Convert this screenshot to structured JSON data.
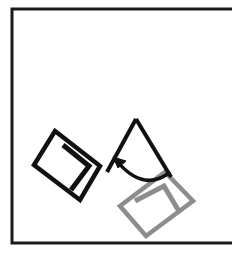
{
  "figure": {
    "title": "Rotation of a square figure",
    "background_color": "#ffffff",
    "frame": {
      "name": "border-frame",
      "stroke_color": "#1a1a1a",
      "stroke_width": 3,
      "x": 11,
      "y": 9,
      "width": 226,
      "height": 234,
      "right_edge_visible": false
    },
    "shapes": [
      {
        "id": "source-square",
        "label": "original square",
        "color": "#111111",
        "stroke_width": 4.5,
        "rotation_deg": -38,
        "points": [
          [
            55,
            131
          ],
          [
            100,
            166
          ],
          [
            80,
            200
          ],
          [
            34,
            165
          ]
        ]
      },
      {
        "id": "source-inner-mark",
        "label": "original inner bracket mark",
        "color": "#111111",
        "stroke_width": 5,
        "points": [
          [
            63,
            145
          ],
          [
            89,
            166
          ],
          [
            71,
            190
          ]
        ]
      },
      {
        "id": "target-square",
        "label": "rotated square copy",
        "color": "#8d8d8d",
        "stroke_width": 4.5,
        "rotation_deg": 42,
        "points": [
          [
            165,
            172
          ],
          [
            193,
            201
          ],
          [
            146,
            236
          ],
          [
            120,
            206
          ]
        ]
      },
      {
        "id": "target-inner-mark",
        "label": "rotated inner bracket mark",
        "color": "#8d8d8d",
        "stroke_width": 5,
        "points": [
          [
            135,
            201
          ],
          [
            164,
            186
          ],
          [
            180,
            213
          ]
        ]
      },
      {
        "id": "rotation-wedge-left",
        "label": "wedge leg toward source square",
        "color": "#111111",
        "stroke_width": 4,
        "points": [
          [
            136,
            119
          ],
          [
            107,
            172
          ]
        ]
      },
      {
        "id": "rotation-wedge-right",
        "label": "wedge leg toward target square",
        "color": "#111111",
        "stroke_width": 4,
        "points": [
          [
            136,
            119
          ],
          [
            171,
            177
          ]
        ]
      }
    ],
    "arrow": {
      "name": "rotation-arrow",
      "color": "#111111",
      "stroke_width": 3.5,
      "direction": "counter-clockwise",
      "arc_start": [
        116,
        160
      ],
      "arc_end": [
        169,
        173
      ],
      "arc_sweep": "concave-up",
      "head_at": "arc_start",
      "head_size": 9
    },
    "colors": {
      "ink": "#111111",
      "ghost": "#8d8d8d",
      "frame": "#1a1a1a",
      "paper": "#ffffff"
    }
  }
}
